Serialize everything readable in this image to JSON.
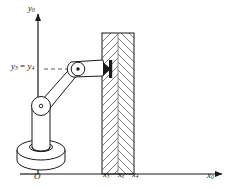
{
  "figure": {
    "background_color": "#ffffff",
    "line_color": "#1a1a1a",
    "hatch_color": "#6b6b6b",
    "axes": {
      "x_axis_label": "x",
      "x_axis_subscript": "0",
      "y_axis_label": "y",
      "y_axis_subscript": "0",
      "origin_label": "O"
    },
    "height_annotation": {
      "left_symbol": "y",
      "left_subscript": "3",
      "equals": " = ",
      "right_symbol": "y",
      "right_subscript": "4",
      "line_style": "dashed"
    },
    "x_ticks": [
      {
        "symbol": "x",
        "subscript": "3"
      },
      {
        "symbol": "x",
        "subscript": "e"
      },
      {
        "symbol": "x",
        "subscript": "4"
      }
    ],
    "parts": {
      "base_disc": "base-disc",
      "column": "vertical-column",
      "shoulder_joint": "shoulder-joint",
      "upper_arm": "upper-arm-link",
      "elbow_joint": "elbow-joint",
      "forearm": "forearm-link",
      "end_effector": "end-effector-tip",
      "wall": "hatched-wall"
    }
  }
}
